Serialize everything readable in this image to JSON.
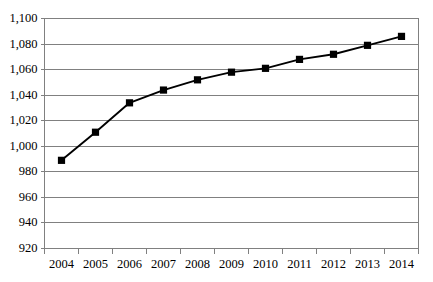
{
  "chart_data": {
    "type": "line",
    "title": "",
    "subtitle": "",
    "xlabel": "",
    "ylabel": "",
    "categories": [
      "2004",
      "2005",
      "2006",
      "2007",
      "2008",
      "2009",
      "2010",
      "2011",
      "2012",
      "2013",
      "2014"
    ],
    "values": [
      989,
      1011,
      1034,
      1044,
      1052,
      1058,
      1061,
      1068,
      1072,
      1079,
      1086
    ],
    "series": [
      {
        "name": "",
        "values": [
          989,
          1011,
          1034,
          1044,
          1052,
          1058,
          1061,
          1068,
          1072,
          1079,
          1086
        ]
      }
    ],
    "ylim": [
      920,
      1100
    ],
    "ytick_values": [
      920,
      940,
      960,
      980,
      1000,
      1020,
      1040,
      1060,
      1080,
      1100
    ],
    "ytick_labels": [
      "920",
      "940",
      "960",
      "980",
      "1,000",
      "1,020",
      "1,040",
      "1,060",
      "1,080",
      "1,100"
    ],
    "xtick_labels": [
      "2004",
      "2005",
      "2006",
      "2007",
      "2008",
      "2009",
      "2010",
      "2011",
      "2012",
      "2013",
      "2014"
    ],
    "grid": "horizontal",
    "legend": "none",
    "annotations": [],
    "style": {
      "line_color": "#000000",
      "marker_color": "#000000",
      "marker_shape": "square",
      "grid_color": "#808080",
      "axis_color": "#808080",
      "background": "#ffffff"
    }
  }
}
